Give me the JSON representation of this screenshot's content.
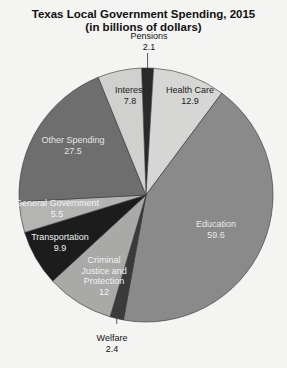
{
  "chart_data": {
    "type": "pie",
    "title": "Texas Local Government Spending, 2015",
    "subtitle": "(in billions of dollars)",
    "start_angle_deg": -2,
    "direction": "clockwise",
    "slices": [
      {
        "label": "Pensions",
        "value": 2.1,
        "color": "#2a2a2a",
        "text_color": "#111",
        "label_lines": [
          "Pensions",
          "2.1"
        ],
        "outside": true
      },
      {
        "label": "Health Care",
        "value": 12.9,
        "color": "#d6d6d4",
        "text_color": "#222",
        "label_lines": [
          "Health Care",
          "12.9"
        ]
      },
      {
        "label": "Education",
        "value": 59.6,
        "color": "#8a8a8a",
        "text_color": "#e8e8e8",
        "label_lines": [
          "Education",
          "59.6"
        ]
      },
      {
        "label": "Welfare",
        "value": 2.4,
        "color": "#3a3a3a",
        "text_color": "#111",
        "label_lines": [
          "Welfare",
          "2.4"
        ],
        "outside": true
      },
      {
        "label": "Criminal Justice and Protection",
        "value": 12,
        "color": "#a9a9a7",
        "text_color": "#f2f2f2",
        "label_lines": [
          "Criminal",
          "Justice and",
          "Protection",
          "12"
        ]
      },
      {
        "label": "Transportation",
        "value": 9.9,
        "color": "#1c1c1c",
        "text_color": "#eeeeee",
        "label_lines": [
          "Transportation",
          "9.9"
        ]
      },
      {
        "label": "General Government",
        "value": 5.5,
        "color": "#b4b4b2",
        "text_color": "#f4f4f4",
        "label_lines": [
          "General Government",
          "5.5"
        ]
      },
      {
        "label": "Other Spending",
        "value": 27.5,
        "color": "#6e6e6e",
        "text_color": "#e4e4e4",
        "label_lines": [
          "Other Spending",
          "27.5"
        ]
      },
      {
        "label": "Interest",
        "value": 7.8,
        "color": "#d0d0ce",
        "text_color": "#222",
        "label_lines": [
          "Interest",
          "7.8"
        ]
      }
    ],
    "legend": null
  }
}
